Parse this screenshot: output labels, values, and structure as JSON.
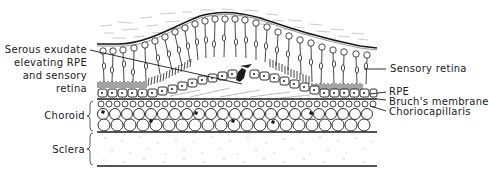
{
  "diagram": {
    "colors": {
      "ink": "#1a1a1a",
      "background": "#ffffff",
      "stipple": "#9a9a9a",
      "fiber": "#b5b5b5"
    },
    "labels": {
      "serous_exudate": [
        "Serous exudate",
        "elevating RPE",
        "and sensory",
        "retina"
      ],
      "sensory_retina": "Sensory retina",
      "rpe": "RPE",
      "bruchs_membrane": "Bruch's membrane",
      "choriocapillaris": "Choriocapillaris",
      "choroid": "Choroid",
      "sclera": "Sclera"
    },
    "layers": [
      {
        "name": "Vitreous / nerve fiber surface",
        "order": 1
      },
      {
        "name": "Sensory retina",
        "order": 2
      },
      {
        "name": "Serous exudate (subretinal / sub-RPE space)",
        "order": 3
      },
      {
        "name": "RPE",
        "order": 4
      },
      {
        "name": "Bruch's membrane",
        "order": 5
      },
      {
        "name": "Choriocapillaris",
        "order": 6
      },
      {
        "name": "Choroid",
        "order": 7
      },
      {
        "name": "Sclera",
        "order": 8
      }
    ]
  }
}
